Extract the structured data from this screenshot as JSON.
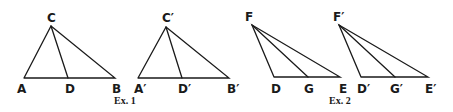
{
  "figures": [
    {
      "caption": "Ex. 1",
      "triangles": [
        {
          "name": "ABC",
          "apex": {
            "label": "C",
            "x": 51,
            "y": 26
          },
          "base": [
            {
              "label": "A",
              "x": 24,
              "y": 78
            },
            {
              "label": "D",
              "x": 68,
              "y": 78
            },
            {
              "label": "B",
              "x": 115,
              "y": 78
            }
          ],
          "cevians": [
            "CD"
          ]
        },
        {
          "name": "A'B'C'",
          "apex": {
            "label": "C′",
            "x": 166,
            "y": 27
          },
          "base": [
            {
              "label": "A′",
              "x": 138,
              "y": 78
            },
            {
              "label": "D′",
              "x": 182,
              "y": 78
            },
            {
              "label": "B′",
              "x": 229,
              "y": 78
            }
          ],
          "cevians": [
            "C′D′"
          ]
        }
      ]
    },
    {
      "caption": "Ex. 2",
      "triangles": [
        {
          "name": "DEF",
          "apex": {
            "label": "F",
            "x": 252,
            "y": 25
          },
          "base": [
            {
              "label": "D",
              "x": 274,
              "y": 77
            },
            {
              "label": "G",
              "x": 308,
              "y": 77
            },
            {
              "label": "E",
              "x": 340,
              "y": 77
            }
          ],
          "cevians": [
            "FG"
          ]
        },
        {
          "name": "D'E'F'",
          "apex": {
            "label": "F′",
            "x": 339,
            "y": 25
          },
          "base": [
            {
              "label": "D′",
              "x": 361,
              "y": 77
            },
            {
              "label": "G′",
              "x": 395,
              "y": 77
            },
            {
              "label": "E′",
              "x": 428,
              "y": 77
            }
          ],
          "cevians": [
            "F′G′"
          ]
        }
      ]
    }
  ],
  "labels": {
    "ex1": {
      "C": "C",
      "A": "A",
      "D": "D",
      "B": "B",
      "C2": "C′",
      "A2": "A′",
      "D2": "D′",
      "B2": "B′",
      "caption": "Ex. 1"
    },
    "ex2": {
      "F": "F",
      "D": "D",
      "G": "G",
      "E": "E",
      "F2": "F′",
      "D2": "D′",
      "G2": "G′",
      "E2": "E′",
      "caption": "Ex. 2"
    }
  }
}
